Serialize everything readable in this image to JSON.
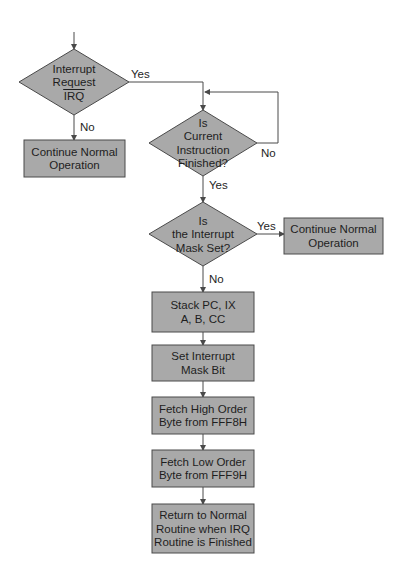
{
  "diagram": {
    "type": "flowchart",
    "colors": {
      "fill": "#a9a9a9",
      "stroke": "#4a4a4a",
      "text": "#1e1e1e",
      "background": "#ffffff"
    },
    "nodes": [
      {
        "id": "irq",
        "shape": "diamond",
        "lines": [
          "Interrupt",
          "Request",
          "IRQ"
        ],
        "overline_last": true,
        "cx": 74,
        "cy": 82,
        "w": 110,
        "h": 66
      },
      {
        "id": "continue1",
        "shape": "rect",
        "lines": [
          "Continue Normal",
          "Operation"
        ],
        "x": 24,
        "y": 140,
        "w": 101,
        "h": 37
      },
      {
        "id": "instr_finished",
        "shape": "diamond",
        "lines": [
          "Is",
          "Current",
          "Instruction",
          "Finished?"
        ],
        "cx": 203,
        "cy": 143,
        "w": 108,
        "h": 66
      },
      {
        "id": "mask_set",
        "shape": "diamond",
        "lines": [
          "Is",
          "the Interrupt",
          "Mask Set?"
        ],
        "cx": 203,
        "cy": 234,
        "w": 108,
        "h": 64
      },
      {
        "id": "continue2",
        "shape": "rect",
        "lines": [
          "Continue Normal",
          "Operation"
        ],
        "x": 284,
        "y": 218,
        "w": 99,
        "h": 36
      },
      {
        "id": "stack",
        "shape": "rect",
        "lines": [
          "Stack PC, IX",
          "A, B, CC"
        ],
        "x": 152,
        "y": 292,
        "w": 102,
        "h": 40
      },
      {
        "id": "set_mask",
        "shape": "rect",
        "lines": [
          "Set Interrupt",
          "Mask Bit"
        ],
        "x": 152,
        "y": 345,
        "w": 102,
        "h": 36
      },
      {
        "id": "fetch_high",
        "shape": "rect",
        "lines": [
          "Fetch High Order",
          "Byte from FFF8H"
        ],
        "x": 152,
        "y": 397,
        "w": 102,
        "h": 37
      },
      {
        "id": "fetch_low",
        "shape": "rect",
        "lines": [
          "Fetch Low Order",
          "Byte from FFF9H"
        ],
        "x": 152,
        "y": 450,
        "w": 102,
        "h": 37
      },
      {
        "id": "return",
        "shape": "rect",
        "lines": [
          "Return to Normal",
          "Routine when IRQ",
          "Routine is Finished"
        ],
        "x": 152,
        "y": 504,
        "w": 102,
        "h": 49
      }
    ],
    "edges": [
      {
        "id": "entry",
        "points": [
          [
            74,
            32
          ],
          [
            74,
            49
          ]
        ],
        "arrow": true,
        "label": ""
      },
      {
        "id": "irq_no",
        "points": [
          [
            74,
            115
          ],
          [
            74,
            140
          ]
        ],
        "arrow": true,
        "label": "No",
        "lx": 80,
        "ly": 131
      },
      {
        "id": "irq_yes",
        "points": [
          [
            129,
            82
          ],
          [
            203,
            82
          ],
          [
            203,
            110
          ]
        ],
        "arrow": true,
        "label": "Yes",
        "lx": 131,
        "ly": 78
      },
      {
        "id": "instr_no_loop",
        "points": [
          [
            257,
            143
          ],
          [
            278,
            143
          ],
          [
            278,
            92
          ],
          [
            205,
            92
          ]
        ],
        "arrow": true,
        "label": "No",
        "lx": 261,
        "ly": 157
      },
      {
        "id": "instr_yes",
        "points": [
          [
            203,
            176
          ],
          [
            203,
            202
          ]
        ],
        "arrow": true,
        "label": "Yes",
        "lx": 209,
        "ly": 189
      },
      {
        "id": "mask_yes",
        "points": [
          [
            257,
            234
          ],
          [
            284,
            234
          ]
        ],
        "arrow": true,
        "label": "Yes",
        "lx": 257,
        "ly": 230
      },
      {
        "id": "mask_no",
        "points": [
          [
            203,
            266
          ],
          [
            203,
            292
          ]
        ],
        "arrow": true,
        "label": "No",
        "lx": 209,
        "ly": 283
      },
      {
        "id": "stack_to_set",
        "points": [
          [
            203,
            332
          ],
          [
            203,
            345
          ]
        ],
        "arrow": true,
        "label": ""
      },
      {
        "id": "set_to_high",
        "points": [
          [
            203,
            381
          ],
          [
            203,
            397
          ]
        ],
        "arrow": true,
        "label": ""
      },
      {
        "id": "high_to_low",
        "points": [
          [
            203,
            434
          ],
          [
            203,
            450
          ]
        ],
        "arrow": true,
        "label": ""
      },
      {
        "id": "low_to_return",
        "points": [
          [
            203,
            487
          ],
          [
            203,
            504
          ]
        ],
        "arrow": true,
        "label": ""
      }
    ]
  }
}
